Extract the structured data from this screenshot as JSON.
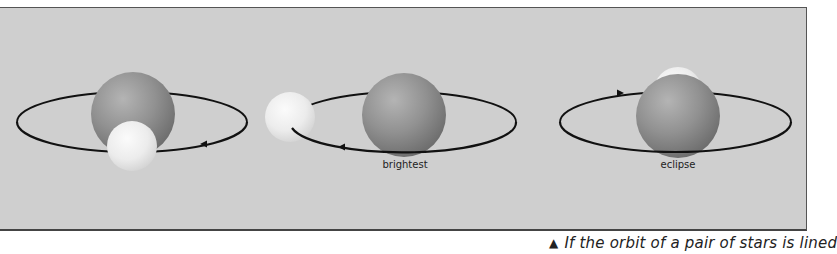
{
  "figure": {
    "background_color": "#cfcfcf",
    "orbit_color": "#111111",
    "large_star_color": "#8f8f8f",
    "small_star_color": "#ececec",
    "panels": [
      {
        "id": "phase-1",
        "label": "",
        "arrow_direction": "left"
      },
      {
        "id": "phase-2",
        "label": "brightest",
        "arrow_direction": "left"
      },
      {
        "id": "phase-3",
        "label": "eclipse",
        "arrow_direction": "right"
      }
    ]
  },
  "caption": {
    "marker": "▲",
    "text": "If the orbit of a pair of stars is lined"
  }
}
